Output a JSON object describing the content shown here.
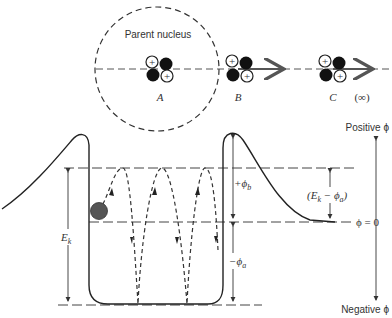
{
  "diagram": {
    "labels": {
      "parent_nucleus": "Parent nucleus",
      "position_a": "A",
      "position_b": "B",
      "position_c": "C",
      "infinity": "(∞)",
      "positive_phi": "Positive ϕ",
      "negative_phi": "Negative ϕ",
      "phi_zero": "ϕ = 0",
      "ek": "E",
      "ek_sub": "k",
      "plus_phi_b": "+ϕ",
      "plus_phi_b_sub": "b",
      "minus_phi_a": "−ϕ",
      "minus_phi_a_sub": "a",
      "ek_minus_phi_a_open": "(E",
      "ek_minus_phi_a_k": "k",
      "ek_minus_phi_a_mid": " − ϕ",
      "ek_minus_phi_a_a": "a",
      "ek_minus_phi_a_close": ")"
    },
    "nucleus_symbol": "+",
    "colors": {
      "line": "#333333",
      "neutron": "#111111",
      "proton_fill": "#ffffff",
      "particle": "#555555"
    }
  }
}
